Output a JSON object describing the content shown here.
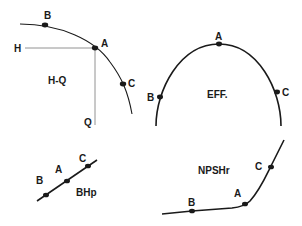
{
  "colors": {
    "curve": "#1a1a1a",
    "guide": "#777777",
    "text": "#1a1a1a",
    "background": "#ffffff"
  },
  "panels": {
    "hq": {
      "title": "H-Q",
      "axis_h_label": "H",
      "axis_q_label": "Q",
      "points": {
        "a": "A",
        "b": "B",
        "c": "C"
      }
    },
    "eff": {
      "title": "EFF.",
      "points": {
        "a": "A",
        "b": "B",
        "c": "C"
      }
    },
    "bhp": {
      "title": "BHp",
      "points": {
        "a": "A",
        "b": "B",
        "c": "C"
      }
    },
    "npshr": {
      "title": "NPSHr",
      "points": {
        "a": "A",
        "b": "B",
        "c": "C"
      }
    }
  }
}
